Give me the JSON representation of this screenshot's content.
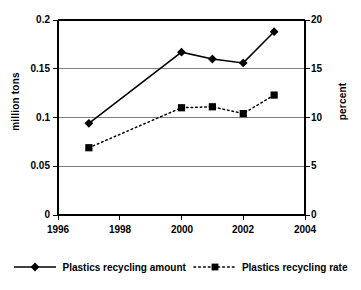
{
  "chart_data": {
    "type": "line",
    "title": "",
    "xlabel": "",
    "ylabel": "million tons",
    "ylabel_right": "percent",
    "x": [
      1997,
      2000,
      2001,
      2002,
      2003
    ],
    "xlim": [
      1996,
      2004
    ],
    "xticks": [
      "1996",
      "1998",
      "2000",
      "2002",
      "2004"
    ],
    "xtick_values": [
      1996,
      1998,
      2000,
      2002,
      2004
    ],
    "ylim": [
      0,
      0.2
    ],
    "yticks": [
      "0",
      "0.05",
      "0.1",
      "0.15",
      "0.2"
    ],
    "ytick_values": [
      0,
      0.05,
      0.1,
      0.15,
      0.2
    ],
    "ylim_right": [
      0,
      20
    ],
    "yticks_right": [
      "0",
      "5",
      "10",
      "15",
      "20"
    ],
    "ytick_values_right": [
      0,
      5,
      10,
      15,
      20
    ],
    "grid": true,
    "legend_position": "bottom",
    "series": [
      {
        "name": "Plastics recycling amount",
        "axis": "left",
        "marker": "diamond",
        "linestyle": "solid",
        "color": "#000000",
        "values": [
          0.094,
          0.167,
          0.16,
          0.156,
          0.188
        ]
      },
      {
        "name": "Plastics recycling rate",
        "axis": "right",
        "marker": "square",
        "linestyle": "dotted",
        "color": "#000000",
        "values": [
          6.9,
          11.0,
          11.1,
          10.4,
          12.3
        ]
      }
    ]
  },
  "legend": {
    "items": [
      {
        "label": "Plastics recycling amount"
      },
      {
        "label": "Plastics recycling rate"
      }
    ]
  },
  "colors": {
    "axis": "#000000",
    "grid": "#808080",
    "series": "#000000",
    "background": "#ffffff"
  }
}
